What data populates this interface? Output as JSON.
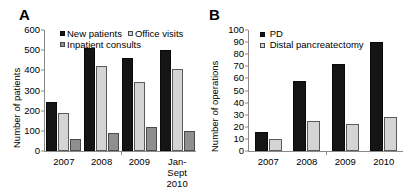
{
  "figure": {
    "panels": [
      {
        "letter": "A",
        "ylabel": "Number of patients",
        "chart_data": {
          "type": "bar",
          "title": "",
          "xlabel": "",
          "ylabel": "Number of patients",
          "ylim": [
            0,
            600
          ],
          "yticks": [
            0,
            100,
            200,
            300,
            400,
            500,
            600
          ],
          "grid": false,
          "legend_position": "top-center",
          "categories": [
            "2007",
            "2008",
            "2009",
            "Jan-Sept\n2010"
          ],
          "series": [
            {
              "name": "New patients",
              "values": [
                243,
                511,
                463,
                503
              ],
              "color": "#151515"
            },
            {
              "name": "Office visits",
              "values": [
                190,
                421,
                343,
                405
              ],
              "color": "#d4d4d4"
            },
            {
              "name": "Inpatient consults",
              "values": [
                58,
                90,
                121,
                98
              ],
              "color": "#8f8f8f"
            }
          ]
        }
      },
      {
        "letter": "B",
        "ylabel": "Number of operations",
        "chart_data": {
          "type": "bar",
          "title": "",
          "xlabel": "",
          "ylabel": "Number of operations",
          "ylim": [
            0,
            100
          ],
          "yticks": [
            0,
            10,
            20,
            30,
            40,
            50,
            60,
            70,
            80,
            90,
            100
          ],
          "grid": false,
          "legend_position": "top-center",
          "categories": [
            "2007",
            "2008",
            "2009",
            "2010"
          ],
          "series": [
            {
              "name": "PD",
              "values": [
                16,
                58,
                72,
                90
              ],
              "color": "#151515"
            },
            {
              "name": "Distal pancreatectomy",
              "values": [
                10,
                25,
                22,
                28
              ],
              "color": "#d4d4d4"
            }
          ]
        }
      }
    ]
  }
}
